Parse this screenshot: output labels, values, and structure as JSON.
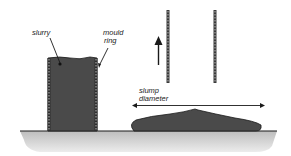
{
  "diagram": {
    "labels": {
      "slurry": "slurry",
      "mould_ring_line1": "mould",
      "mould_ring_line2": "ring",
      "slump_line1": "slump",
      "slump_line2": "diameter"
    },
    "colors": {
      "slurry_fill": "#4a4a4a",
      "ground_fill": "#cfcfcf",
      "ring_fill": "#3a3a3a",
      "line": "#1a1a1a"
    }
  }
}
